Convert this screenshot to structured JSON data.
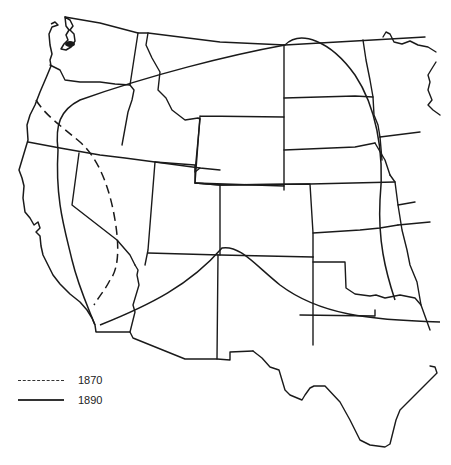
{
  "map": {
    "region": "Western United States",
    "line_color": "#1a1a1a",
    "background": "#ffffff",
    "frontier_lines": [
      {
        "year": "1870",
        "style": "dashed"
      },
      {
        "year": "1890",
        "style": "solid"
      }
    ]
  },
  "legend": {
    "items": [
      {
        "label": "1870",
        "style": "dashed"
      },
      {
        "label": "1890",
        "style": "solid"
      }
    ]
  }
}
